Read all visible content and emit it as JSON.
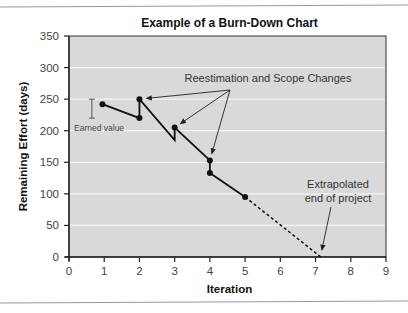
{
  "chart_data": {
    "type": "line",
    "title": "Example of a Burn-Down Chart",
    "xlabel": "Iteration",
    "ylabel": "Remaining Effort (days)",
    "xlim": [
      0,
      9
    ],
    "ylim": [
      0,
      350
    ],
    "x_ticks": [
      "0",
      "1",
      "2",
      "3",
      "4",
      "5",
      "6",
      "7",
      "8",
      "9"
    ],
    "y_ticks": [
      "0",
      "50",
      "100",
      "150",
      "200",
      "250",
      "300",
      "350"
    ],
    "grid": "horizontal",
    "series": [
      {
        "name": "Remaining effort",
        "style": "solid",
        "points": [
          {
            "x": 0.95,
            "y": 242,
            "marker": true
          },
          {
            "x": 2.0,
            "y": 220,
            "marker": true
          },
          {
            "x": 2.0,
            "y": 250,
            "marker": true
          },
          {
            "x": 3.0,
            "y": 185,
            "marker": false
          },
          {
            "x": 3.0,
            "y": 205,
            "marker": true
          },
          {
            "x": 4.0,
            "y": 153,
            "marker": true
          },
          {
            "x": 4.0,
            "y": 133,
            "marker": true
          },
          {
            "x": 5.0,
            "y": 95,
            "marker": true
          }
        ]
      },
      {
        "name": "Extrapolation",
        "style": "dashed",
        "points": [
          {
            "x": 5.0,
            "y": 95
          },
          {
            "x": 7.15,
            "y": 0
          }
        ]
      }
    ],
    "annotations": [
      {
        "text": "Reestimation and Scope Changes",
        "targets": [
          {
            "x": 2.0,
            "y": 250
          },
          {
            "x": 3.0,
            "y": 205
          },
          {
            "x": 4.0,
            "y": 153
          }
        ]
      },
      {
        "text": "Earned value",
        "range": [
          220,
          250
        ],
        "x": 0.65
      },
      {
        "text": "Extrapolated end of project",
        "lines": [
          "Extrapolated",
          "end of project"
        ],
        "target": {
          "x": 7.15,
          "y": 0
        }
      }
    ],
    "colors": {
      "plot_bg": "#d9d9d9",
      "grid": "#f4f4f4",
      "line": "#111111",
      "border": "#333333"
    }
  }
}
